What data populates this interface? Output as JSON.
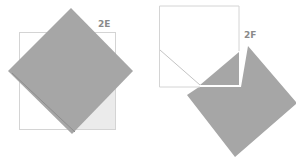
{
  "figures": [
    {
      "id": "2E",
      "label": "2E",
      "description": "Gray square rotated 45 degrees overlapping a white outlined square, with a fold line along lower-left edge"
    },
    {
      "id": "2F",
      "label": "2F",
      "description": "White outlined square with diagonal fold line and a notch, gray rotated square extending to lower-right"
    }
  ],
  "colors": {
    "paper_gray": "#a6a6a6",
    "paper_outline": "#d4d4d4",
    "paper_light": "#ebebeb",
    "label": "#8a8a8a",
    "background": "#ffffff"
  }
}
